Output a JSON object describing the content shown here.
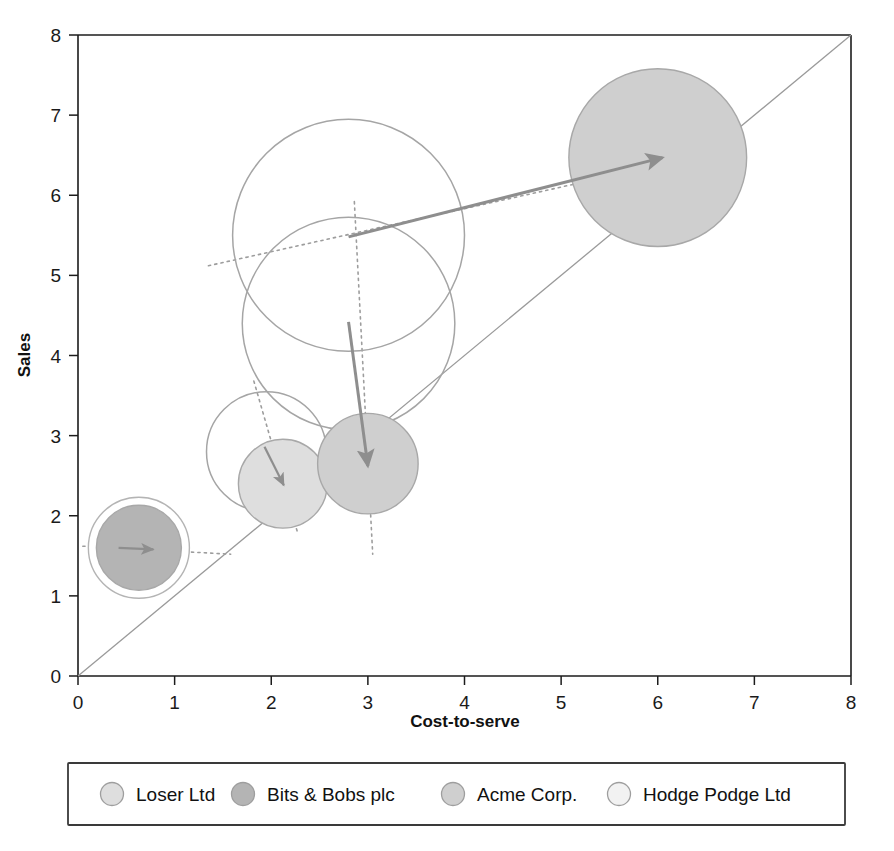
{
  "chart_data": {
    "type": "scatter",
    "title": "",
    "xlabel": "Cost-to-serve",
    "ylabel": "Sales",
    "xlim": [
      0,
      8
    ],
    "ylim": [
      0,
      8
    ],
    "xticks": [
      "0",
      "1",
      "2",
      "3",
      "4",
      "5",
      "6",
      "7",
      "8"
    ],
    "yticks": [
      "0",
      "1",
      "2",
      "3",
      "4",
      "5",
      "6",
      "7",
      "8"
    ],
    "grid": false,
    "legend_position": "bottom",
    "reference_line": {
      "name": "break-even-diagonal",
      "from": [
        0,
        0
      ],
      "to": [
        8,
        8
      ]
    },
    "series": [
      {
        "name": "Hodge Podge Ltd",
        "color": "#fbfbfb",
        "filled": false,
        "points": [
          {
            "label": "Hodge Podge Ltd start",
            "x": 2.8,
            "y": 5.5,
            "size": 1.2,
            "state": "outline"
          },
          {
            "label": "Hodge Podge Ltd end",
            "x": 2.8,
            "y": 4.4,
            "size": 1.1,
            "state": "outline"
          }
        ]
      },
      {
        "name": "Loser Ltd",
        "color": "#dedede",
        "filled": true,
        "points": [
          {
            "label": "Loser Ltd start",
            "x": 1.95,
            "y": 2.8,
            "size": 0.62,
            "state": "outline"
          },
          {
            "label": "Loser Ltd end",
            "x": 2.12,
            "y": 2.4,
            "size": 0.46,
            "state": "filled"
          }
        ]
      },
      {
        "name": "Acme Corp.",
        "color": "#cfcfcf",
        "filled": true,
        "points": [
          {
            "label": "Acme Corp. end",
            "x": 3.0,
            "y": 2.65,
            "size": 0.52,
            "state": "filled"
          },
          {
            "label": "Acme Corp. target",
            "x": 6.0,
            "y": 6.47,
            "size": 0.92,
            "state": "filled"
          }
        ]
      },
      {
        "name": "Bits & Bobs plc",
        "color": "#b4b4b4",
        "filled": true,
        "points": [
          {
            "label": "Bits & Bobs plc",
            "x": 0.63,
            "y": 1.6,
            "size": 0.44,
            "state": "filled"
          }
        ]
      }
    ],
    "movement_arrows": [
      {
        "name": "acme-growth-arrow",
        "from": [
          2.8,
          5.48
        ],
        "to": [
          6.05,
          6.47
        ]
      },
      {
        "name": "hodge-podge-drop-arrow",
        "from": [
          2.8,
          4.42
        ],
        "to": [
          3.0,
          2.62
        ]
      },
      {
        "name": "loser-drift-arrow",
        "from": [
          1.93,
          2.86
        ],
        "to": [
          2.13,
          2.38
        ]
      },
      {
        "name": "bits-bobs-flat-arrow",
        "from": [
          0.42,
          1.6
        ],
        "to": [
          0.78,
          1.58
        ]
      }
    ],
    "trend_dotted_lines": [
      {
        "name": "acme-trend-dotted",
        "from": [
          1.35,
          5.12
        ],
        "to": [
          6.85,
          6.6
        ]
      },
      {
        "name": "hodge-podge-trend-dotted",
        "from": [
          2.86,
          5.92
        ],
        "to": [
          3.05,
          1.52
        ]
      },
      {
        "name": "loser-trend-dotted",
        "from": [
          1.82,
          3.68
        ],
        "to": [
          2.27,
          1.8
        ]
      },
      {
        "name": "bits-bobs-trend-dotted",
        "from": [
          0.05,
          1.62
        ],
        "to": [
          1.58,
          1.52
        ]
      }
    ]
  },
  "legend": {
    "items": [
      {
        "label": "Loser Ltd",
        "color": "#dedede"
      },
      {
        "label": "Bits & Bobs plc",
        "color": "#b4b4b4"
      },
      {
        "label": "Acme Corp.",
        "color": "#cfcfcf"
      },
      {
        "label": "Hodge Podge Ltd",
        "color": "#f2f2f2"
      }
    ]
  }
}
